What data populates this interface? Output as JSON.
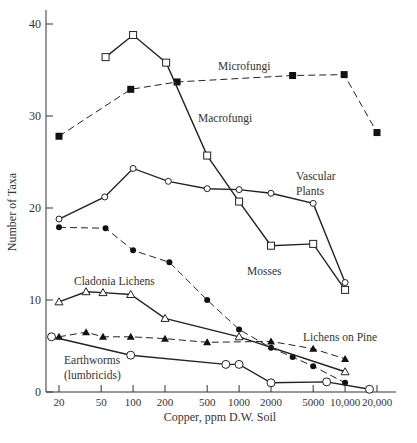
{
  "chart_data": {
    "type": "line",
    "title": "",
    "xlabel": "Copper, ppm D.W. Soil",
    "ylabel": "Number of Taxa",
    "xscale": "log",
    "xlim": [
      15,
      25000
    ],
    "ylim": [
      0,
      42
    ],
    "x_ticks": [
      20,
      50,
      100,
      200,
      500,
      1000,
      2000,
      5000,
      10000,
      20000
    ],
    "x_tick_labels": [
      "20",
      "50",
      "100",
      "200",
      "500",
      "1000",
      "2000",
      "5000",
      "10,000",
      "20,000"
    ],
    "y_ticks": [
      0,
      10,
      20,
      30,
      40
    ],
    "y_tick_labels": [
      "0",
      "10",
      "20",
      "30",
      "40"
    ],
    "grid": false,
    "legend": "inline labels",
    "series": [
      {
        "name": "Microfungi",
        "style": "dashed",
        "marker": "filled-square",
        "label_pos": [
          218,
          70
        ],
        "x": [
          20,
          95,
          260,
          3200,
          9800,
          20000
        ],
        "y": [
          27.8,
          32.9,
          33.7,
          34.4,
          34.5,
          28.2
        ]
      },
      {
        "name": "Macrofungi",
        "style": "solid",
        "marker": "open-square",
        "label_pos": [
          198,
          122
        ],
        "x": [
          55,
          100,
          205,
          500,
          1000,
          2000,
          5000,
          10000
        ],
        "y": [
          36.4,
          38.8,
          35.8,
          25.7,
          20.7,
          15.9,
          16.1,
          11.1
        ]
      },
      {
        "name": "Vascular Plants",
        "style": "solid",
        "marker": "open-circle",
        "label_pos": [
          296,
          180
        ],
        "x": [
          20,
          54,
          100,
          215,
          500,
          1000,
          2000,
          5000,
          10000
        ],
        "y": [
          18.8,
          21.2,
          24.3,
          22.9,
          22.1,
          22.0,
          21.6,
          20.5,
          11.9
        ]
      },
      {
        "name": "Mosses",
        "style": "dashed",
        "marker": "filled-circle",
        "label_pos": [
          247,
          275
        ],
        "x": [
          20,
          55,
          100,
          220,
          500,
          1000,
          2000,
          3200,
          5000,
          10000
        ],
        "y": [
          17.9,
          17.8,
          15.4,
          14.1,
          10.0,
          6.8,
          4.8,
          3.8,
          2.8,
          1.0
        ]
      },
      {
        "name": "Cladonia Lichens",
        "style": "solid",
        "marker": "open-triangle",
        "label_pos": [
          74,
          285
        ],
        "x": [
          20,
          36,
          52,
          95,
          200,
          1000,
          10000
        ],
        "y": [
          9.8,
          10.9,
          10.8,
          10.6,
          8.0,
          6.0,
          2.2
        ]
      },
      {
        "name": "Lichens on Pine",
        "style": "dashed",
        "marker": "filled-triangle",
        "label_pos": [
          303,
          341
        ],
        "x": [
          20,
          36,
          52,
          95,
          200,
          500,
          2000,
          5000,
          10000
        ],
        "y": [
          6.0,
          6.5,
          6.0,
          6.0,
          5.8,
          5.4,
          5.5,
          4.7,
          3.6
        ]
      },
      {
        "name": "Earthworms (lumbricids)",
        "label_lines": [
          "Earthworms",
          "(lumbricids)"
        ],
        "style": "solid",
        "marker": "open-circle-large",
        "label_pos": [
          64,
          364
        ],
        "x": [
          17,
          95,
          750,
          1000,
          2000,
          6700,
          17000
        ],
        "y": [
          6.0,
          4.0,
          3.0,
          3.0,
          1.0,
          1.1,
          0.3
        ]
      }
    ]
  }
}
